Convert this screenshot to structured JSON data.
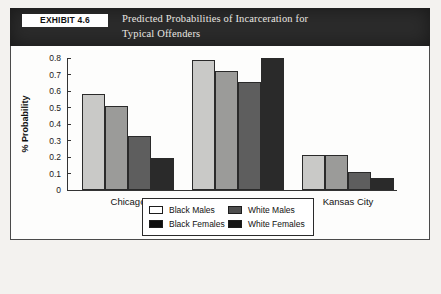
{
  "exhibit": {
    "tag": "EXHIBIT 4.6",
    "title_line1": "Predicted Probabilities of Incarceration for",
    "title_line2": "Typical Offenders"
  },
  "chart_data": {
    "type": "bar",
    "title": "Predicted Probabilities of Incarceration for Typical Offenders",
    "xlabel": "",
    "ylabel": "% Probability",
    "ylim": [
      0,
      0.8
    ],
    "yticks": [
      "0",
      "0.1",
      "0.2",
      "0.3",
      "0.4",
      "0.5",
      "0.6",
      "0.7",
      "0.8"
    ],
    "grid": false,
    "legend_position": "bottom",
    "categories": [
      "Chicago",
      "Miami",
      "Kansas City"
    ],
    "series": [
      {
        "name": "Black Males",
        "swatch": "white",
        "color": "#c9c9c7",
        "values": [
          0.58,
          0.79,
          0.215
        ]
      },
      {
        "name": "White Males",
        "swatch": "gray",
        "color": "#9b9b99",
        "values": [
          0.51,
          0.72,
          0.215
        ]
      },
      {
        "name": "Black Females",
        "swatch": "black",
        "color": "#5e5e5e",
        "values": [
          0.325,
          0.655,
          0.11
        ]
      },
      {
        "name": "White Females",
        "swatch": "dark",
        "color": "#2a2a2a",
        "values": [
          0.195,
          0.8,
          0.075
        ]
      }
    ]
  },
  "colors": {
    "header_bg": "#2b2b2b",
    "panel_bg": "#fdfdfc",
    "frame": "#4a4a4a"
  }
}
